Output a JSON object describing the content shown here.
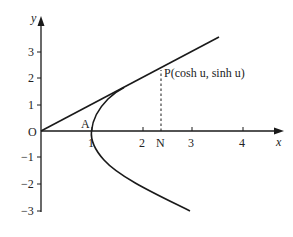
{
  "diagram": {
    "axes": {
      "x_label": "x",
      "y_label": "y",
      "x_ticks": [
        "1",
        "2",
        "3",
        "4"
      ],
      "y_ticks": [
        "3",
        "2",
        "1",
        "−1",
        "−2",
        "−3"
      ],
      "origin_label": "O"
    },
    "points": {
      "A": {
        "label": "A",
        "x": 1,
        "y": 0
      },
      "P": {
        "label": "P(cosh u, sinh u)",
        "x": 2.38,
        "y": 2.16
      },
      "N": {
        "label": "N",
        "x": 2.38,
        "y": 0
      }
    },
    "curves": {
      "hyperbola": "x = cosh t, y = sinh t, from y≈−3 to y≈1.6",
      "line": "line through O and P, from (0,0) to (3.5,3.55)",
      "dashed": "vertical dashed segment from N to P"
    },
    "colors": {
      "stroke": "#1a1a1a",
      "background": "#ffffff"
    }
  }
}
